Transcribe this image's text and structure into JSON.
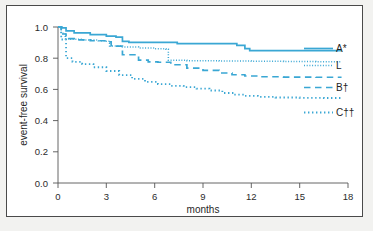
{
  "chart_data": {
    "type": "line",
    "title": "",
    "subtitle": "",
    "xlabel": "months",
    "ylabel": "event-free survival",
    "xlim": [
      0,
      18
    ],
    "ylim": [
      0.0,
      1.0
    ],
    "xticks": [
      "0",
      "3",
      "6",
      "9",
      "12",
      "15",
      "18"
    ],
    "yticks": [
      "1.0",
      "0.8",
      "0.6",
      "0.4",
      "0.2",
      "0.0"
    ],
    "grid": false,
    "legend_position": "right-inside",
    "line_color": "#3aa7d4",
    "series": [
      {
        "name": "A*",
        "label": "A*",
        "style": "solid",
        "color": "#3aa7d4",
        "x": [
          0,
          0.25,
          0.5,
          1.0,
          2.0,
          3.0,
          3.6,
          4.0,
          4.4,
          6.0,
          7.0,
          7.4,
          9.0,
          10.6,
          11.1,
          11.6,
          11.9,
          14.0,
          17.6
        ],
        "y": [
          1.0,
          0.995,
          0.975,
          0.962,
          0.951,
          0.941,
          0.935,
          0.908,
          0.902,
          0.902,
          0.902,
          0.893,
          0.893,
          0.893,
          0.882,
          0.862,
          0.849,
          0.849,
          0.849
        ]
      },
      {
        "name": "L",
        "label": "L",
        "style": "dotted-fine",
        "color": "#3aa7d4",
        "x": [
          0,
          0.2,
          0.45,
          0.8,
          1.5,
          2.5,
          3.0,
          3.2,
          4.0,
          5.0,
          6.0,
          6.7,
          6.85,
          8.0,
          10.0,
          12.0,
          14.0,
          16.0,
          17.6
        ],
        "y": [
          1.0,
          0.96,
          0.925,
          0.921,
          0.916,
          0.912,
          0.908,
          0.879,
          0.872,
          0.866,
          0.861,
          0.858,
          0.787,
          0.784,
          0.782,
          0.78,
          0.779,
          0.778,
          0.778
        ]
      },
      {
        "name": "B†",
        "label": "B†",
        "style": "dashed-long",
        "color": "#3aa7d4",
        "x": [
          0,
          0.2,
          0.5,
          1.0,
          2.0,
          3.0,
          3.3,
          4.0,
          5.0,
          5.6,
          6.2,
          7.0,
          8.0,
          9.0,
          10.0,
          10.8,
          11.6,
          12.4,
          14.0,
          16.0,
          17.6
        ],
        "y": [
          1.0,
          0.955,
          0.925,
          0.918,
          0.912,
          0.905,
          0.878,
          0.822,
          0.788,
          0.776,
          0.774,
          0.758,
          0.737,
          0.722,
          0.705,
          0.694,
          0.686,
          0.681,
          0.679,
          0.678,
          0.678
        ]
      },
      {
        "name": "C††",
        "label": "C††",
        "style": "dotted-round",
        "color": "#3aa7d4",
        "x": [
          0,
          0.2,
          0.5,
          0.9,
          1.5,
          2.2,
          3.0,
          3.8,
          4.6,
          5.4,
          6.2,
          7.0,
          7.8,
          8.6,
          9.4,
          10.2,
          10.9,
          11.6,
          12.4,
          13.5,
          15.0,
          16.5,
          17.6
        ],
        "y": [
          1.0,
          0.92,
          0.8,
          0.777,
          0.762,
          0.742,
          0.718,
          0.692,
          0.667,
          0.648,
          0.634,
          0.623,
          0.614,
          0.605,
          0.593,
          0.577,
          0.566,
          0.558,
          0.552,
          0.548,
          0.546,
          0.545,
          0.545
        ]
      }
    ]
  }
}
